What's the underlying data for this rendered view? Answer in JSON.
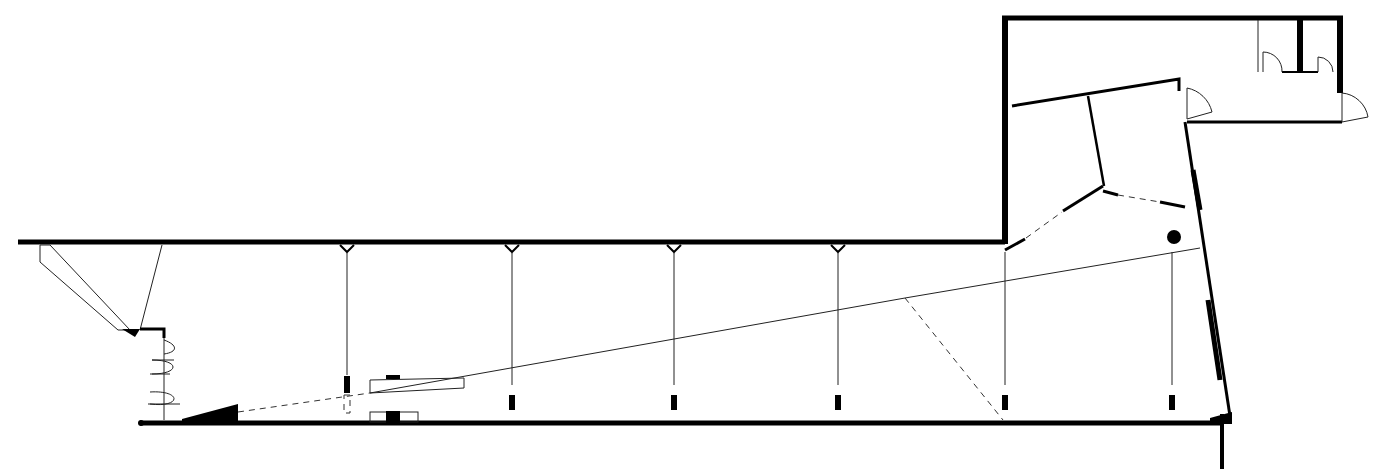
{
  "drawing": {
    "type": "architectural-floor-plan",
    "width": 1379,
    "height": 469,
    "colors": {
      "ink": "#000000",
      "background": "#ffffff"
    },
    "walls": [
      {
        "name": "north-wall-main",
        "points": "18,242 1005,242",
        "w": 5
      },
      {
        "name": "west-wing-wall-vertical",
        "points": "1005,242 1005,18",
        "w": 6
      },
      {
        "name": "top-wall",
        "points": "1003,18 1342,18",
        "w": 5
      },
      {
        "name": "east-annex-wall",
        "points": "1340,18 1340,92",
        "w": 6
      },
      {
        "name": "annex-bottom-wall",
        "points": "1187,122 1342,122",
        "w": 3
      },
      {
        "name": "inner-wall-diagonal",
        "points": "1012,105 1179,79 1179,90",
        "w": 3
      },
      {
        "name": "inner-wall-partition",
        "points": "1088,96 1103,186",
        "w": 2.5
      },
      {
        "name": "east-slanted-wall",
        "points": "1185,122 1230,415",
        "w": 3
      },
      {
        "name": "south-wall-main",
        "points": "140,423 1222,423",
        "w": 5
      },
      {
        "name": "south-east-stub",
        "points": "1222,415 1222,469",
        "w": 4
      },
      {
        "name": "wc-partition",
        "points": "1300,20 1300,72",
        "w": 6
      }
    ],
    "hangers_x": [
      347,
      512,
      674,
      838
    ],
    "posts": [
      {
        "x": 347,
        "y": 378
      },
      {
        "x": 512,
        "y": 397
      },
      {
        "x": 674,
        "y": 397
      },
      {
        "x": 838,
        "y": 397
      },
      {
        "x": 1005,
        "y": 397
      },
      {
        "x": 1172,
        "y": 397
      }
    ],
    "column": {
      "cx": 1174,
      "cy": 237,
      "r": 7
    }
  }
}
